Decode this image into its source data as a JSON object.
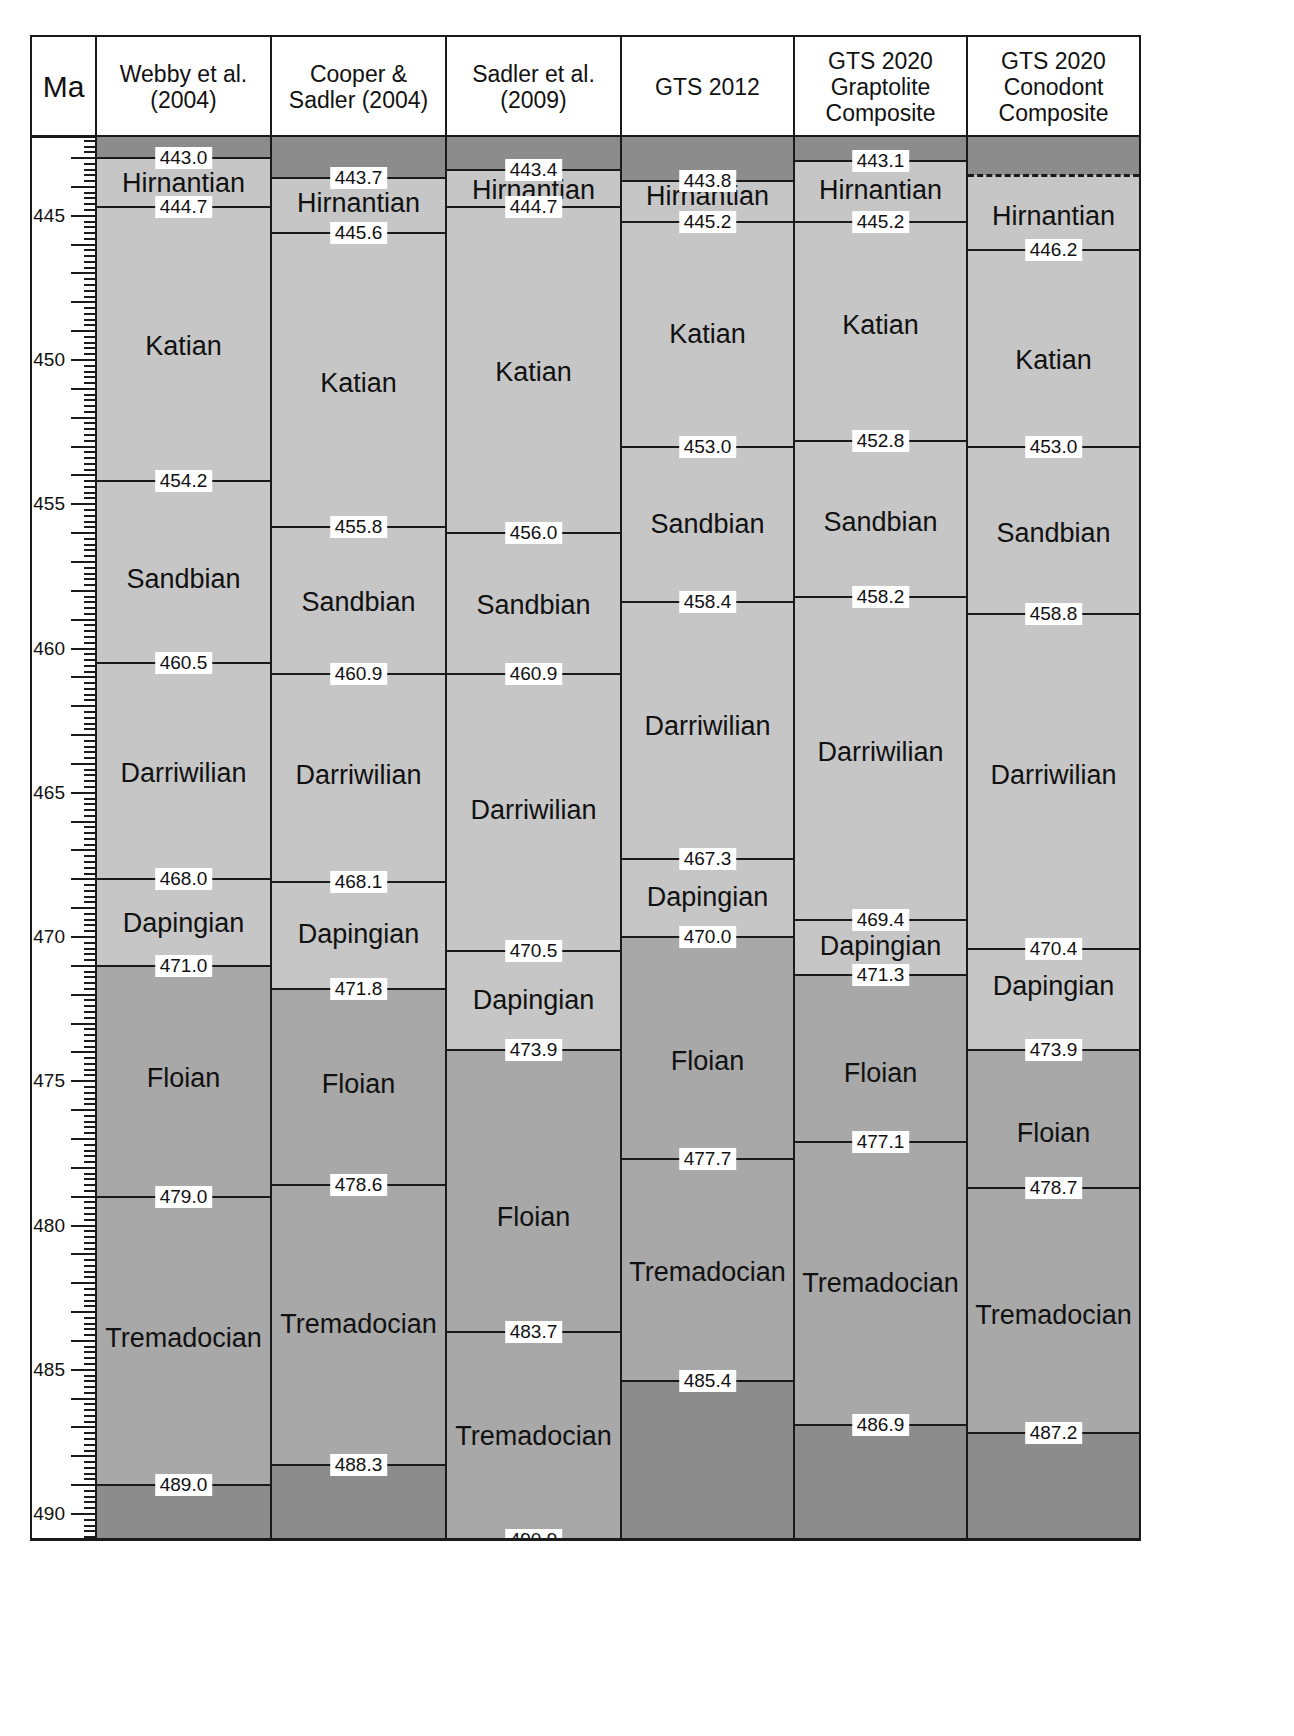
{
  "chart_data": {
    "type": "table",
    "title": "",
    "axis": {
      "label": "Ma",
      "min": 442.27,
      "max": 490.9,
      "px_per_ma": 28.85,
      "top_px": 137,
      "major_ticks": [
        445,
        450,
        455,
        460,
        465,
        470,
        475,
        480,
        485,
        490
      ]
    },
    "colors": {
      "outside": "#8c8c8c",
      "lower": "#a8a8a8",
      "upper": "#c6c6c6",
      "line": "#1a1a1a",
      "label_bg": "#ffffff"
    },
    "columns": [
      {
        "id": "webby",
        "header": "Webby et al.\n(2004)",
        "bands": [
          {
            "from": 442.27,
            "to": 443.0,
            "shade": "outside"
          },
          {
            "from": 443.0,
            "to": 471.0,
            "shade": "upper"
          },
          {
            "from": 471.0,
            "to": 489.0,
            "shade": "lower"
          },
          {
            "from": 489.0,
            "to": 490.9,
            "shade": "outside"
          }
        ],
        "boundaries": [
          443.0,
          444.7,
          454.2,
          460.5,
          468.0,
          471.0,
          479.0,
          489.0
        ],
        "stages": [
          {
            "name": "Hirnantian",
            "at": 443.85
          },
          {
            "name": "Katian",
            "at": 449.5
          },
          {
            "name": "Sandbian",
            "at": 457.6
          },
          {
            "name": "Darriwilian",
            "at": 464.3
          },
          {
            "name": "Dapingian",
            "at": 469.5
          },
          {
            "name": "Floian",
            "at": 474.9
          },
          {
            "name": "Tremadocian",
            "at": 483.9
          }
        ]
      },
      {
        "id": "cooper",
        "header": "Cooper &\nSadler (2004)",
        "bands": [
          {
            "from": 442.27,
            "to": 443.7,
            "shade": "outside"
          },
          {
            "from": 443.7,
            "to": 471.8,
            "shade": "upper"
          },
          {
            "from": 471.8,
            "to": 488.3,
            "shade": "lower"
          },
          {
            "from": 488.3,
            "to": 490.9,
            "shade": "outside"
          }
        ],
        "boundaries": [
          443.7,
          444.7,
          445.6,
          455.8,
          460.9,
          468.1,
          471.8,
          478.6,
          488.3
        ],
        "boundaries_hidden_lines": [
          444.7
        ],
        "stages": [
          {
            "name": "Hirnantian",
            "at": 444.55
          },
          {
            "name": "Katian",
            "at": 450.8
          },
          {
            "name": "Sandbian",
            "at": 458.4
          },
          {
            "name": "Darriwilian",
            "at": 464.4
          },
          {
            "name": "Dapingian",
            "at": 469.9
          },
          {
            "name": "Floian",
            "at": 475.1
          },
          {
            "name": "Tremadocian",
            "at": 483.4
          }
        ]
      },
      {
        "id": "sadler",
        "header": "Sadler et al.\n(2009)",
        "bands": [
          {
            "from": 442.27,
            "to": 443.4,
            "shade": "outside"
          },
          {
            "from": 443.4,
            "to": 473.9,
            "shade": "upper"
          },
          {
            "from": 473.9,
            "to": 490.9,
            "shade": "lower"
          }
        ],
        "boundaries": [
          443.4,
          444.7,
          456.0,
          460.9,
          470.5,
          473.9,
          483.7,
          490.9
        ],
        "stages": [
          {
            "name": "Hirnantian",
            "at": 444.1
          },
          {
            "name": "Katian",
            "at": 450.4
          },
          {
            "name": "Sandbian",
            "at": 458.5
          },
          {
            "name": "Darriwilian",
            "at": 465.6
          },
          {
            "name": "Dapingian",
            "at": 472.2
          },
          {
            "name": "Floian",
            "at": 479.7
          },
          {
            "name": "Tremadocian",
            "at": 487.3
          }
        ]
      },
      {
        "id": "gts2012",
        "header": "GTS 2012",
        "bands": [
          {
            "from": 442.27,
            "to": 443.8,
            "shade": "outside"
          },
          {
            "from": 443.8,
            "to": 470.0,
            "shade": "upper"
          },
          {
            "from": 470.0,
            "to": 485.4,
            "shade": "lower"
          },
          {
            "from": 485.4,
            "to": 490.9,
            "shade": "outside"
          }
        ],
        "boundaries": [
          443.8,
          445.2,
          453.0,
          458.4,
          467.3,
          470.0,
          477.7,
          485.4
        ],
        "stages": [
          {
            "name": "Hirnantian",
            "at": 444.3
          },
          {
            "name": "Katian",
            "at": 449.1
          },
          {
            "name": "Sandbian",
            "at": 455.7
          },
          {
            "name": "Darriwilian",
            "at": 462.7
          },
          {
            "name": "Dapingian",
            "at": 468.6
          },
          {
            "name": "Floian",
            "at": 474.3
          },
          {
            "name": "Tremadocian",
            "at": 481.6
          }
        ]
      },
      {
        "id": "gts2020g",
        "header": "GTS 2020\nGraptolite\nComposite",
        "bands": [
          {
            "from": 442.27,
            "to": 443.1,
            "shade": "outside"
          },
          {
            "from": 443.1,
            "to": 471.3,
            "shade": "upper"
          },
          {
            "from": 471.3,
            "to": 486.9,
            "shade": "lower"
          },
          {
            "from": 486.9,
            "to": 490.9,
            "shade": "outside"
          }
        ],
        "boundaries": [
          443.1,
          445.2,
          452.8,
          458.2,
          469.4,
          471.3,
          477.1,
          486.9
        ],
        "stages": [
          {
            "name": "Hirnantian",
            "at": 444.1
          },
          {
            "name": "Katian",
            "at": 448.8
          },
          {
            "name": "Sandbian",
            "at": 455.6
          },
          {
            "name": "Darriwilian",
            "at": 463.6
          },
          {
            "name": "Dapingian",
            "at": 470.3
          },
          {
            "name": "Floian",
            "at": 474.7
          },
          {
            "name": "Tremadocian",
            "at": 482.0
          }
        ]
      },
      {
        "id": "gts2020c",
        "header": "GTS 2020\nConodont\nComposite",
        "bands": [
          {
            "from": 442.27,
            "to": 443.6,
            "shade": "outside"
          },
          {
            "from": 443.6,
            "to": 473.9,
            "shade": "upper"
          },
          {
            "from": 473.9,
            "to": 487.2,
            "shade": "lower"
          },
          {
            "from": 487.2,
            "to": 490.9,
            "shade": "outside"
          }
        ],
        "boundaries": [
          446.2,
          453.0,
          458.8,
          470.4,
          473.9,
          478.7,
          487.2
        ],
        "dashed_boundary": 443.6,
        "stages": [
          {
            "name": "Hirnantian",
            "at": 445.0
          },
          {
            "name": "Katian",
            "at": 450.0
          },
          {
            "name": "Sandbian",
            "at": 456.0
          },
          {
            "name": "Darriwilian",
            "at": 464.4
          },
          {
            "name": "Dapingian",
            "at": 471.7
          },
          {
            "name": "Floian",
            "at": 476.8
          },
          {
            "name": "Tremadocian",
            "at": 483.1
          }
        ]
      }
    ]
  },
  "header": {
    "axis_label": "Ma"
  }
}
